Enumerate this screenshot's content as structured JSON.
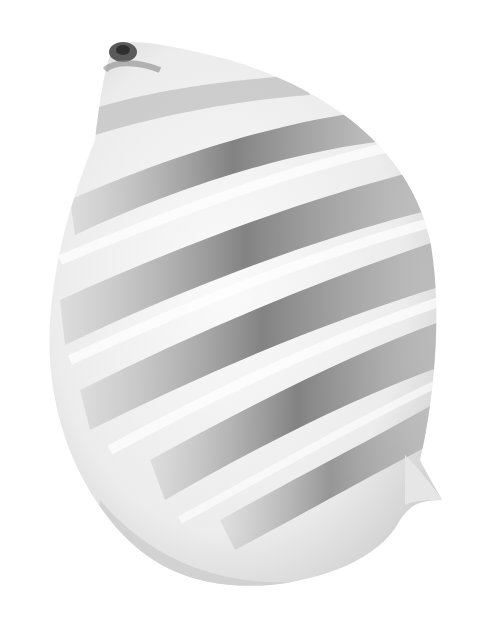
{
  "image": {
    "subject": "seashell",
    "description": "Grayscale photo of a spiral sea snail shell with dark banded stripes on a white background",
    "background_color": "#ffffff",
    "colors": {
      "shell_light": "#f2f2f2",
      "shell_mid": "#d6d6d6",
      "band_dark": "#7a7a7a",
      "apex_dark": "#5a5a5a"
    }
  }
}
